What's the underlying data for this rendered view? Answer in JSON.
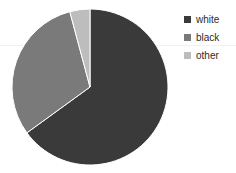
{
  "chart_data": {
    "type": "pie",
    "title": "",
    "categories": [
      "white",
      "black",
      "other"
    ],
    "values": [
      65,
      31,
      4
    ],
    "units": "percent",
    "colors": [
      "#3a3a3a",
      "#7a7a7a",
      "#bdbdbd"
    ],
    "start_angle_deg": 0,
    "direction": "clockwise",
    "legend_position": "right",
    "grid": true,
    "slices": [
      {
        "label": "white",
        "value": 65,
        "color": "#3a3a3a",
        "start_deg": 0,
        "end_deg": 234
      },
      {
        "label": "black",
        "value": 31,
        "color": "#7a7a7a",
        "start_deg": 234,
        "end_deg": 345
      },
      {
        "label": "other",
        "value": 4,
        "color": "#bdbdbd",
        "start_deg": 345,
        "end_deg": 360
      }
    ]
  },
  "legend": {
    "items": [
      {
        "label": "white",
        "color": "#3a3a3a"
      },
      {
        "label": "black",
        "color": "#7a7a7a"
      },
      {
        "label": "other",
        "color": "#bdbdbd"
      }
    ]
  },
  "geometry": {
    "center_x": 90,
    "center_y": 87,
    "radius": 78
  },
  "style": {
    "background": "#ffffff",
    "gridline_color": "#f1f1f1",
    "label_color": "#2b2b2b"
  }
}
